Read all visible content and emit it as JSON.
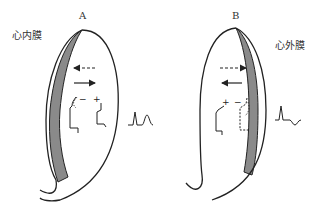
{
  "diagram": {
    "panels": [
      {
        "id": "A",
        "label": "A",
        "layer_label": "心内膜",
        "shaded_side": "left",
        "signs": {
          "left": "−",
          "right": "+"
        },
        "arrows": [
          {
            "style": "dashed",
            "direction": "left"
          },
          {
            "style": "solid",
            "direction": "right"
          }
        ],
        "ecg_wave": "upright-T"
      },
      {
        "id": "B",
        "label": "B",
        "layer_label": "心外膜",
        "shaded_side": "right",
        "signs": {
          "left": "+",
          "right": "−"
        },
        "arrows": [
          {
            "style": "dashed",
            "direction": "right"
          },
          {
            "style": "solid",
            "direction": "left"
          }
        ],
        "ecg_wave": "inverted-T"
      }
    ],
    "colors": {
      "line": "#222222",
      "shade": "#8a8a8a"
    }
  }
}
